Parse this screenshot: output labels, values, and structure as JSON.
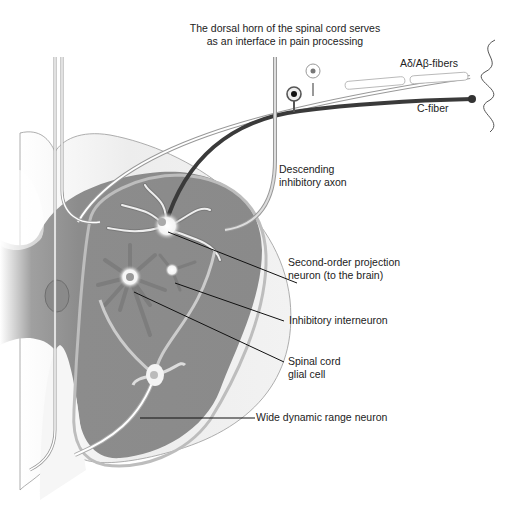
{
  "title": {
    "line1": "The dorsal horn of the spinal cord serves",
    "line2": "as an interface in pain processing"
  },
  "labels": {
    "a_fibers": "Aδ/Aβ-fibers",
    "c_fiber": "C-fiber",
    "descending_1": "Descending",
    "descending_2": "inhibitory axon",
    "projection_1": "Second-order projection",
    "projection_2": "neuron (to the brain)",
    "interneuron": "Inhibitory interneuron",
    "glial_1": "Spinal cord",
    "glial_2": "glial cell",
    "wdr": "Wide dynamic range neuron"
  },
  "colors": {
    "grey_matter": "#8c8c8c",
    "white_matter": "#ececec",
    "c_fiber": "#3a3a3a",
    "outline": "#888888",
    "leader": "#111111"
  }
}
